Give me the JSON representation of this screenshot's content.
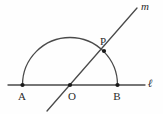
{
  "figure": {
    "kind": "geometry-diagram",
    "background_color": "#fefefe",
    "stroke_color": "#4a4a4a",
    "label_color": "#2b2b2b",
    "point_color": "#1a1a1a",
    "stroke_width": 1.3,
    "canvas": {
      "width": 163,
      "height": 114
    }
  },
  "lines": [
    {
      "name": "line-l",
      "label": "ℓ",
      "label_x": 150,
      "label_y": 83,
      "x1": 8,
      "y1": 85,
      "x2": 145,
      "y2": 85
    },
    {
      "name": "line-m",
      "label": "m",
      "label_x": 145,
      "label_y": 6,
      "x1": 47,
      "y1": 111,
      "x2": 137,
      "y2": 8
    }
  ],
  "arc": {
    "name": "semicircle-arc",
    "center_x": 70,
    "center_y": 85,
    "radius": 47.5,
    "path": "M 22.5 85 A 47.5 47.5 0 0 1 117.5 85"
  },
  "points": [
    {
      "name": "point-a",
      "label": "A",
      "x": 22.5,
      "y": 85,
      "label_x": 22,
      "label_y": 96,
      "radius": 2.1
    },
    {
      "name": "point-o",
      "label": "O",
      "x": 70,
      "y": 85,
      "label_x": 72,
      "label_y": 96,
      "radius": 2.1
    },
    {
      "name": "point-b",
      "label": "B",
      "x": 117.5,
      "y": 85,
      "label_x": 117,
      "label_y": 96,
      "radius": 2.1
    },
    {
      "name": "point-p",
      "label": "P",
      "x": 104,
      "y": 51,
      "label_x": 103,
      "label_y": 41,
      "radius": 2.1
    }
  ]
}
